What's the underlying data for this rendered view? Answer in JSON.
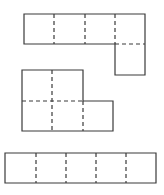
{
  "diagram": {
    "stroke_color": "#3a3a3a",
    "background": "#ffffff",
    "cell_size": 30,
    "nets": [
      {
        "name": "net-1",
        "outline": "M24 14 L145 14 L145 75 L115 75 L115 44 L24 44 Z",
        "folds": [
          "M54 14 L54 44",
          "M85 14 L85 44",
          "M115 14 L115 44",
          "M115 44 L145 44"
        ]
      },
      {
        "name": "net-2",
        "outline": "M22 70 L83 70 L83 101 L113 101 L113 131 L22 131 Z",
        "folds": [
          "M52 70 L52 131",
          "M22 101 L83 101",
          "M83 101 L83 131"
        ]
      },
      {
        "name": "net-3",
        "outline": "M5 153 L156 153 L156 183 L5 183 Z",
        "folds": [
          "M36 153 L36 183",
          "M66 153 L66 183",
          "M96 153 L96 183",
          "M126 153 L126 183"
        ]
      }
    ]
  }
}
